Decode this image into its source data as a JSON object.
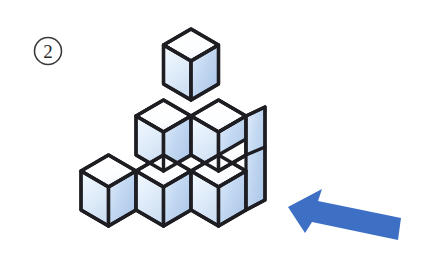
{
  "figure": {
    "item_number": "2",
    "item_number_icon": "circled-number-icon",
    "arrow_icon": "left-pointing-arrow-icon",
    "arrow_direction": "left",
    "colors": {
      "outline": "#1d1d22",
      "cube_top_face": "#ffffff",
      "cube_left_face_light": "#eef6fd",
      "cube_left_face_shade": "#d2e2f4",
      "cube_right_face_light": "#dbe8f8",
      "cube_right_face_shade": "#adc7e9",
      "arrow_fill": "#3d6fc4",
      "circle_stroke": "#3a3a3a",
      "background": "#ffffff"
    },
    "geometry": {
      "origin_x": 191,
      "origin_y": 203,
      "half_width": 27.5,
      "half_depth": 16,
      "cube_height": 39,
      "stroke_width": 3.2
    },
    "cubes": [
      {
        "name": "bottom-front-left",
        "i": 0,
        "j": 1,
        "k": 0
      },
      {
        "name": "bottom-front-center",
        "i": 0,
        "j": 0,
        "k": 0
      },
      {
        "name": "bottom-front-right",
        "i": 1,
        "j": 0,
        "k": 0
      },
      {
        "name": "middle-back-left",
        "i": 1,
        "j": 1,
        "k": 1
      },
      {
        "name": "middle-back-right",
        "i": 1,
        "j": 0,
        "k": 1
      },
      {
        "name": "top-apex",
        "i": 1,
        "j": 1,
        "k": 2
      }
    ],
    "cube_count_visible": 6,
    "arrow": {
      "tip_x": 288,
      "tip_y": 207,
      "tail_x": 401,
      "tail_y": 234
    }
  }
}
